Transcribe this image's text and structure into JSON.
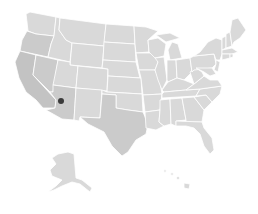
{
  "map": {
    "type": "us-states-choropleth",
    "base_color": "#d9d9d9",
    "border_color": "#ffffff",
    "background": "#ffffff",
    "shaded_regions": [
      {
        "name": "California",
        "color": "#c3c3c3"
      },
      {
        "name": "Nevada",
        "color": "#cbcbcb"
      },
      {
        "name": "Oregon",
        "color": "#cbcbcb"
      },
      {
        "name": "Arizona",
        "color": "#cbcbcb"
      },
      {
        "name": "Texas",
        "color": "#cbcbcb"
      }
    ],
    "markers": [
      {
        "name": "location-marker",
        "state": "Arizona",
        "x": 61,
        "y": 101,
        "r": 3,
        "color": "#3a3a3a"
      }
    ],
    "insets": [
      "Alaska",
      "Hawaii"
    ]
  }
}
